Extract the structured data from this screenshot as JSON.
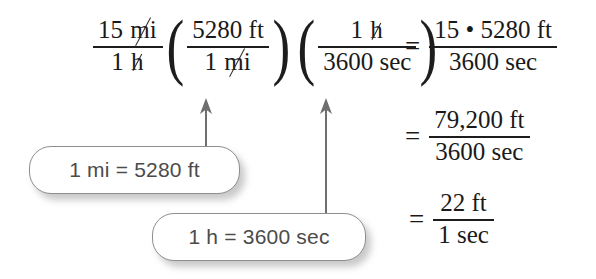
{
  "figure": {
    "kind": "unit-conversion-worked-example",
    "background_color": "#ffffff",
    "ink_color": "#1d1d1d",
    "callout_border_color": "#8e8e8e",
    "callout_text_color": "#4b4b4b"
  },
  "expression": {
    "factor1": {
      "numerator": "15 mi",
      "numerator_value": "15",
      "numerator_unit": "mi",
      "numerator_unit_cancelled": true,
      "denominator": "1 h",
      "denominator_value": "1",
      "denominator_unit": "h",
      "denominator_unit_cancelled": true
    },
    "factor2": {
      "open_paren": "(",
      "close_paren": ")",
      "numerator": "5280 ft",
      "numerator_value": "5280",
      "numerator_unit": "ft",
      "numerator_unit_cancelled": false,
      "denominator": "1 mi",
      "denominator_value": "1",
      "denominator_unit": "mi",
      "denominator_unit_cancelled": true
    },
    "factor3": {
      "open_paren": "(",
      "close_paren": ")",
      "numerator": "1 h",
      "numerator_value": "1",
      "numerator_unit": "h",
      "numerator_unit_cancelled": true,
      "denominator": "3600 sec",
      "denominator_value": "3600",
      "denominator_unit": "sec",
      "denominator_unit_cancelled": false
    }
  },
  "results": [
    {
      "equals": "=",
      "numerator": "15 • 5280 ft",
      "denominator": "3600 sec"
    },
    {
      "equals": "=",
      "numerator": "79,200 ft",
      "denominator": "3600 sec"
    },
    {
      "equals": "=",
      "numerator": "22 ft",
      "denominator": "1 sec"
    }
  ],
  "callouts": [
    {
      "id": "mi",
      "text": "1 mi = 5280 ft",
      "points_to": "5280 ft numerator of second factor"
    },
    {
      "id": "h",
      "text": "1 h = 3600 sec",
      "points_to": "1 h numerator of third factor"
    }
  ],
  "arrows": [
    {
      "id": "arrow-mi",
      "direction": "up",
      "from": "callout 1 mi = 5280 ft",
      "to": "5280 ft"
    },
    {
      "id": "arrow-h",
      "direction": "up",
      "from": "callout 1 h = 3600 sec",
      "to": "1 h"
    }
  ]
}
